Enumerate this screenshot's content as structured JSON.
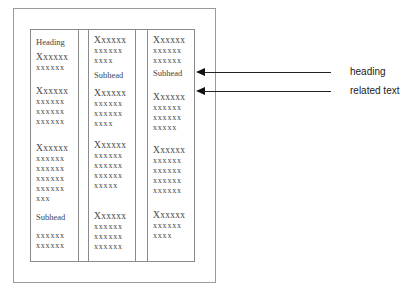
{
  "diagram": {
    "columns": [
      {
        "blocks": [
          {
            "type": "heading",
            "text": "Heading",
            "top": 7
          },
          {
            "type": "para",
            "top": 22,
            "lines": [
              "Xxxxxx",
              "xxxxxx"
            ]
          },
          {
            "type": "para",
            "top": 56,
            "lines": [
              "Xxxxxx",
              "xxxxxx",
              "xxxxxx",
              "xxxxxx"
            ]
          },
          {
            "type": "para",
            "top": 113,
            "lines": [
              "Xxxxxx",
              "xxxxxx",
              "xxxxxx",
              "xxxxxx",
              "xxxxxx",
              "xxx"
            ]
          },
          {
            "type": "heading",
            "text": "Subhead",
            "top": 182
          },
          {
            "type": "para",
            "top": 201,
            "lines": [
              "xxxxxx",
              "xxxxxx"
            ]
          }
        ]
      },
      {
        "blocks": [
          {
            "type": "para",
            "top": 5,
            "lines": [
              "Xxxxxx",
              "xxxxxx",
              "xxxx"
            ]
          },
          {
            "type": "heading",
            "text": "Subhead",
            "top": 40
          },
          {
            "type": "para",
            "top": 58,
            "lines": [
              "Xxxxxx",
              "xxxxxx",
              "xxxxxx",
              "xxxx"
            ]
          },
          {
            "type": "para",
            "top": 110,
            "lines": [
              "Xxxxxx",
              "xxxxxx",
              "xxxxxx",
              "xxxxxx",
              "xxxxx"
            ]
          },
          {
            "type": "para",
            "top": 181,
            "lines": [
              "Xxxxxx",
              "xxxxxx",
              "xxxxxx",
              "xxxxxx"
            ]
          }
        ]
      },
      {
        "blocks": [
          {
            "type": "para",
            "top": 5,
            "lines": [
              "Xxxxxx",
              "xxxxxx",
              "xxxxxx"
            ]
          },
          {
            "type": "heading",
            "text": "Subhead",
            "top": 38
          },
          {
            "type": "para",
            "top": 62,
            "lines": [
              "Xxxxxx",
              "xxxxxx",
              "xxxxxx",
              "xxxxx"
            ]
          },
          {
            "type": "para",
            "top": 115,
            "lines": [
              "Xxxxxx",
              "xxxxxx",
              "xxxxxx",
              "xxxxxx",
              "xxxxxx"
            ]
          },
          {
            "type": "para",
            "top": 180,
            "lines": [
              "Xxxxxx",
              "xxxxxx",
              "xxxx"
            ]
          }
        ]
      }
    ],
    "callouts": [
      {
        "label": "heading",
        "y": 72
      },
      {
        "label": "related text",
        "y": 91
      }
    ]
  }
}
